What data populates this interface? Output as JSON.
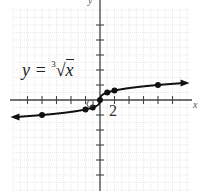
{
  "chart_data": {
    "type": "line",
    "xlabel": "x",
    "ylabel": "y",
    "xlim": [
      -12,
      12
    ],
    "ylim": [
      -12,
      12
    ],
    "x_tick_step": 2,
    "y_tick_step": 2,
    "grid": true,
    "tick_labels": [
      "2"
    ],
    "series": [
      {
        "name": "y = ∛x",
        "points": [
          {
            "x": -8,
            "y": -2
          },
          {
            "x": -2,
            "y": -1.26
          },
          {
            "x": -1,
            "y": -1
          },
          {
            "x": 0,
            "y": 0
          },
          {
            "x": 1,
            "y": 1
          },
          {
            "x": 2,
            "y": 1.26
          },
          {
            "x": 8,
            "y": 2
          }
        ],
        "arrows_both_ends": true
      }
    ]
  },
  "labels": {
    "equation_prefix": "y = ",
    "equation_index": "3",
    "equation_radicand": "x",
    "tick_two": "2",
    "origin": "O",
    "y_axis": "y",
    "x_axis": "x"
  },
  "colors": {
    "curve": "#111111",
    "axis": "#444444",
    "grid": "#d8d8d8"
  }
}
